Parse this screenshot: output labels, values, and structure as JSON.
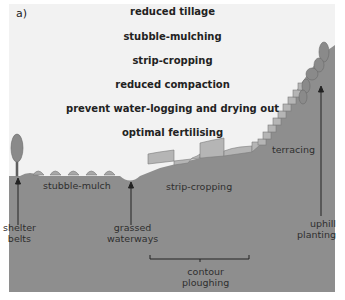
{
  "panel_label": "a)",
  "measures": [
    "reduced tillage",
    "stubble-mulching",
    "strip-cropping",
    "reduced compaction",
    "prevent water-logging and drying out",
    "optimal fertilising"
  ],
  "annotations": {
    "stubble_mulch": "stubble-mulch",
    "strip_cropping": "strip-cropping",
    "terracing": "terracing",
    "shelter_belts_1": "shelter",
    "shelter_belts_2": "belts",
    "grassed_waterways_1": "grassed",
    "grassed_waterways_2": "waterways",
    "contour_ploughing_1": "contour",
    "contour_ploughing_2": "ploughing",
    "uphill_planting_1": "uphill",
    "uphill_planting_2": "planting"
  },
  "colors": {
    "sky": "#f2f2f2",
    "ground": "#8e8e8e",
    "strips": "#b5b5b5",
    "trees": "#8a8a8a",
    "text": "#2e2e2e"
  }
}
